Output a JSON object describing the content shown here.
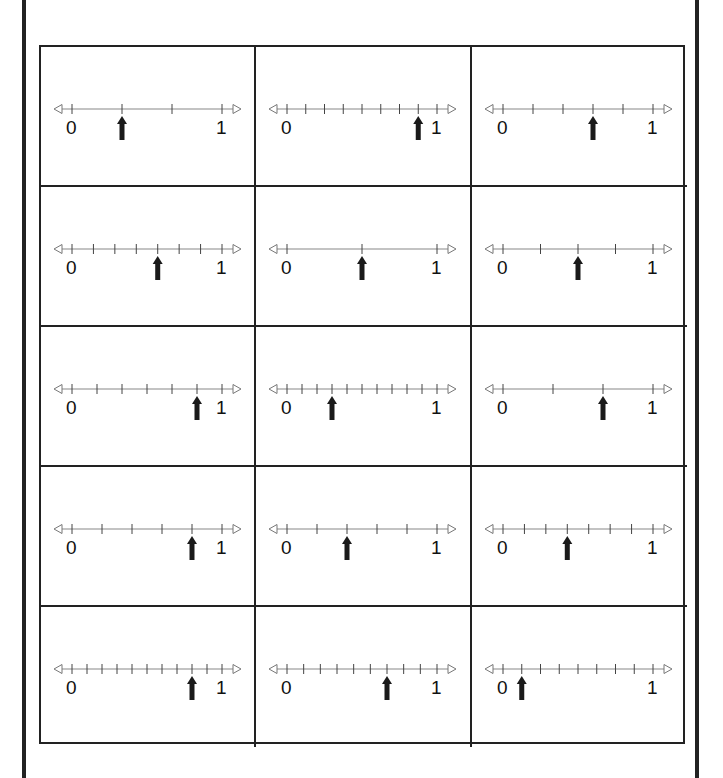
{
  "worksheet": {
    "labels": {
      "start": "0",
      "end": "1"
    },
    "cards": [
      {
        "divisions": 3,
        "arrow_at": 1,
        "fraction": "1/3"
      },
      {
        "divisions": 8,
        "arrow_at": 7,
        "fraction": "7/8"
      },
      {
        "divisions": 5,
        "arrow_at": 3,
        "fraction": "3/5"
      },
      {
        "divisions": 7,
        "arrow_at": 4,
        "fraction": "4/7"
      },
      {
        "divisions": 2,
        "arrow_at": 1,
        "fraction": "1/2"
      },
      {
        "divisions": 4,
        "arrow_at": 2,
        "fraction": "2/4"
      },
      {
        "divisions": 6,
        "arrow_at": 5,
        "fraction": "5/6"
      },
      {
        "divisions": 10,
        "arrow_at": 3,
        "fraction": "3/10"
      },
      {
        "divisions": 3,
        "arrow_at": 2,
        "fraction": "2/3"
      },
      {
        "divisions": 5,
        "arrow_at": 4,
        "fraction": "4/5"
      },
      {
        "divisions": 5,
        "arrow_at": 2,
        "fraction": "2/5"
      },
      {
        "divisions": 7,
        "arrow_at": 3,
        "fraction": "3/7"
      },
      {
        "divisions": 10,
        "arrow_at": 8,
        "fraction": "8/10"
      },
      {
        "divisions": 9,
        "arrow_at": 6,
        "fraction": "6/9"
      },
      {
        "divisions": 8,
        "arrow_at": 1,
        "fraction": "1/8"
      }
    ]
  },
  "colors": {
    "line": "#888888",
    "tick": "#444444",
    "arrow": "#1a1a1a",
    "border": "#222222"
  }
}
